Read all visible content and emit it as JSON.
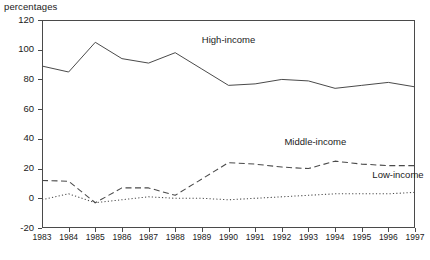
{
  "chart_data": {
    "type": "line",
    "title": "",
    "subtitle": "",
    "ylabel": "percentages",
    "xlabel": "",
    "ylim": [
      -20,
      120
    ],
    "yticks": [
      120,
      100,
      80,
      60,
      40,
      20,
      0,
      -20
    ],
    "ytick_labels": [
      "120",
      "100",
      "80",
      "60",
      "40",
      "20",
      "0",
      "-20"
    ],
    "grid": false,
    "legend_position": "inline-annotations",
    "x": [
      1983,
      1984,
      1985,
      1986,
      1987,
      1988,
      1989,
      1990,
      1991,
      1992,
      1993,
      1994,
      1995,
      1996,
      1997
    ],
    "xtick_labels": [
      "1983",
      "1984",
      "1985",
      "1986",
      "1987",
      "1988",
      "1989",
      "1990",
      "1991",
      "1992",
      "1993",
      "1994",
      "1995",
      "1996",
      "1997"
    ],
    "series": [
      {
        "name": "High-income",
        "style": "solid",
        "color": "#4a4a4a",
        "values": [
          89,
          85,
          105,
          94,
          91,
          98,
          87,
          76,
          77,
          80,
          79,
          74,
          76,
          78,
          75
        ]
      },
      {
        "name": "Middle-income",
        "style": "dashed",
        "color": "#4a4a4a",
        "values": [
          12,
          11.5,
          -3,
          7,
          7,
          2,
          13,
          24,
          23,
          21,
          20,
          25,
          23,
          22,
          22
        ]
      },
      {
        "name": "Low-income",
        "style": "dotted",
        "color": "#4a4a4a",
        "values": [
          -1,
          3,
          -3,
          -1,
          1,
          0,
          0,
          -1,
          0,
          1,
          2,
          3,
          3,
          3,
          4
        ]
      }
    ],
    "annotations": [
      {
        "text": "High-income",
        "x": 1989.0,
        "y": 106
      },
      {
        "text": "Middle-income",
        "x": 1992.1,
        "y": 37
      },
      {
        "text": "Low-income",
        "x": 1995.4,
        "y": 15
      }
    ]
  }
}
